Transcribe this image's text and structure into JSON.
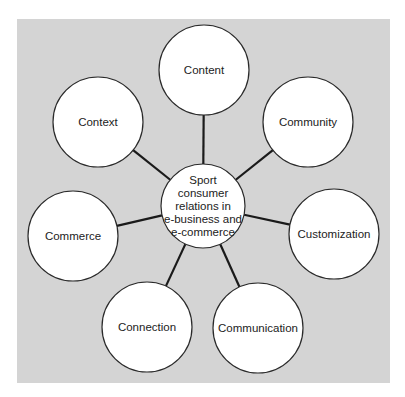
{
  "diagram": {
    "type": "hub-and-spoke",
    "background_color": "#d4d4d4",
    "panel": {
      "x": 17,
      "y": 19,
      "width": 373,
      "height": 364
    },
    "center": {
      "lines": [
        "Sport",
        "consumer",
        "relations in",
        "e-business and",
        "e-commerce"
      ],
      "cx": 203,
      "cy": 206,
      "r": 42
    },
    "nodes": [
      {
        "label": "Content",
        "cx": 204,
        "cy": 70,
        "r": 45
      },
      {
        "label": "Community",
        "cx": 308,
        "cy": 122,
        "r": 45
      },
      {
        "label": "Customization",
        "cx": 334,
        "cy": 234,
        "r": 45
      },
      {
        "label": "Communication",
        "cx": 258,
        "cy": 328,
        "r": 45
      },
      {
        "label": "Connection",
        "cx": 147,
        "cy": 327,
        "r": 45
      },
      {
        "label": "Commerce",
        "cx": 73,
        "cy": 236,
        "r": 45
      },
      {
        "label": "Context",
        "cx": 98,
        "cy": 122,
        "r": 45
      }
    ]
  }
}
